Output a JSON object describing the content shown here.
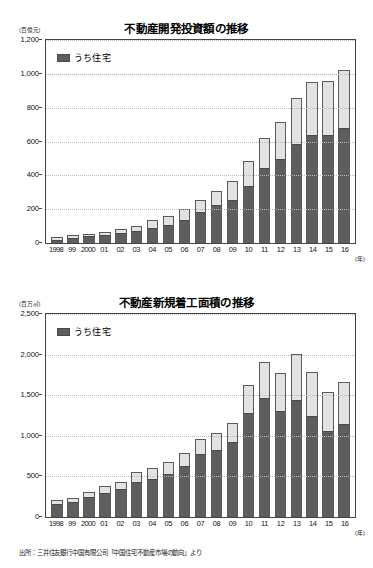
{
  "source_note": "出所：三井住友銀行中国有限公司「中国住宅不動産市場の動向」より",
  "legend_label": "うち住宅",
  "x_unit_label": "(年)",
  "chart_data": [
    {
      "type": "bar",
      "id": "real-estate-development-investment",
      "title": "不動産開発投資額の推移",
      "subtitle": "",
      "xlabel": "(年)",
      "ylabel": "(百億元)",
      "unit": "(百億元)",
      "ylim": [
        0,
        1200
      ],
      "yticks": [
        0,
        200,
        400,
        600,
        800,
        1000,
        1200
      ],
      "ytick_labels": [
        "0",
        "200",
        "400",
        "600",
        "800",
        "1,000",
        "1,200"
      ],
      "grid": true,
      "stacked": true,
      "legend_position": "top-left",
      "categories": [
        "1998",
        "99",
        "2000",
        "01",
        "02",
        "03",
        "04",
        "05",
        "06",
        "07",
        "08",
        "09",
        "10",
        "11",
        "12",
        "13",
        "14",
        "15",
        "16"
      ],
      "series": [
        {
          "name": "うち住宅",
          "color": "#5e5e5e",
          "values": [
            22,
            35,
            45,
            50,
            65,
            78,
            93,
            110,
            143,
            186,
            228,
            261,
            344,
            449,
            499,
            592,
            643,
            644,
            686
          ]
        },
        {
          "name": "その他",
          "color": "#e2e2e2",
          "values": [
            12,
            12,
            8,
            13,
            15,
            22,
            42,
            52,
            60,
            70,
            82,
            106,
            143,
            170,
            215,
            266,
            308,
            315,
            337
          ]
        }
      ],
      "totals": [
        34,
        47,
        53,
        63,
        80,
        100,
        135,
        162,
        203,
        256,
        310,
        367,
        487,
        619,
        714,
        858,
        951,
        959,
        1023
      ]
    },
    {
      "type": "bar",
      "id": "real-estate-new-construction-floor-area",
      "title": "不動産新規着工面積の推移",
      "subtitle": "",
      "xlabel": "(年)",
      "ylabel": "(百万㎡)",
      "unit": "(百万㎡)",
      "ylim": [
        0,
        2500
      ],
      "yticks": [
        0,
        500,
        1000,
        1500,
        2000,
        2500
      ],
      "ytick_labels": [
        "0",
        "500",
        "1,000",
        "1,500",
        "2,000",
        "2,500"
      ],
      "grid": true,
      "stacked": true,
      "legend_position": "top-left",
      "categories": [
        "1998",
        "99",
        "2000",
        "01",
        "02",
        "03",
        "04",
        "05",
        "06",
        "07",
        "08",
        "09",
        "10",
        "11",
        "12",
        "13",
        "14",
        "15",
        "16"
      ],
      "series": [
        {
          "name": "うち住宅",
          "color": "#5e5e5e",
          "values": [
            165,
            195,
            255,
            305,
            350,
            440,
            475,
            545,
            640,
            790,
            840,
            935,
            1290,
            1470,
            1310,
            1455,
            1250,
            1070,
            1155
          ]
        },
        {
          "name": "その他",
          "color": "#e2e2e2",
          "values": [
            45,
            40,
            50,
            75,
            85,
            110,
            130,
            135,
            150,
            170,
            190,
            225,
            340,
            445,
            460,
            555,
            540,
            475,
            510
          ]
        }
      ],
      "totals": [
        210,
        235,
        305,
        380,
        435,
        550,
        605,
        680,
        790,
        960,
        1030,
        1160,
        1630,
        1915,
        1770,
        2010,
        1790,
        1545,
        1665
      ]
    }
  ]
}
